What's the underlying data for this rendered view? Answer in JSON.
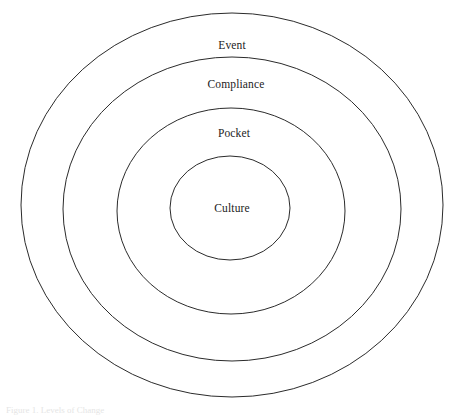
{
  "figure": {
    "type": "concentric-rings-diagram",
    "background_color": "#ffffff",
    "stroke_color": "#2b2b2b",
    "text_color": "#1c1c1c",
    "caption": "Figure 1. Levels of Change",
    "rings": [
      {
        "label": "Event",
        "level": 1,
        "position": "outermost",
        "cx": 232,
        "cy": 205,
        "rx": 211,
        "ry": 192
      },
      {
        "label": "Compliance",
        "level": 2,
        "position": "second",
        "cx": 232,
        "cy": 209,
        "rx": 169,
        "ry": 152
      },
      {
        "label": "Pocket",
        "level": 3,
        "position": "third",
        "cx": 231,
        "cy": 211,
        "rx": 114,
        "ry": 103
      },
      {
        "label": "Culture",
        "level": 4,
        "position": "innermost",
        "cx": 230,
        "cy": 208,
        "rx": 60,
        "ry": 52
      }
    ]
  },
  "chart_data": {
    "type": "pie",
    "title": "",
    "categories": [
      "Event",
      "Compliance",
      "Pocket",
      "Culture"
    ],
    "values": [
      4,
      3,
      2,
      1
    ],
    "xlabel": "",
    "ylabel": "",
    "legend": "none",
    "grid": false,
    "annotations": [
      "Event",
      "Compliance",
      "Pocket",
      "Culture"
    ]
  }
}
